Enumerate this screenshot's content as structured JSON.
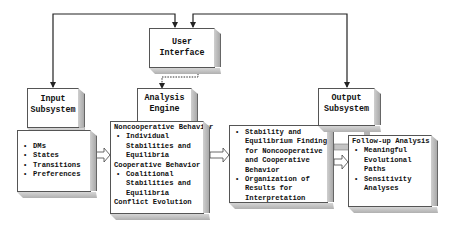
{
  "user_interface": {
    "title_line1": "User",
    "title_line2": "Interface"
  },
  "input": {
    "title_line1": "Input",
    "title_line2": "Subsystem",
    "items": [
      "DMs",
      "States",
      "Transitions",
      "Preferences"
    ]
  },
  "analysis": {
    "title_line1": "Analysis",
    "title_line2": "Engine",
    "sections": [
      {
        "heading": "Noncooperative Behavior",
        "item": "Individual\nStabilities and\nEquilibria"
      },
      {
        "heading": "Cooperative Behavior",
        "item": "Coalitional\nStabilities and\nEquilibria"
      }
    ],
    "footer": "Conflict Evolution"
  },
  "stability": {
    "items": [
      "Stability and\nEquilibrium Findings\nfor Noncooperative\nand Cooperative\nBehavior",
      "Organization of\nResults for\nInterpretation"
    ]
  },
  "output": {
    "title_line1": "Output",
    "title_line2": "Subsystem",
    "heading": "Follow-up Analysis",
    "items": [
      "Meaningful\nEvolutional\nPaths",
      "Sensitivity\nAnalyses"
    ]
  },
  "bullet_glyph": "•",
  "colors": {
    "line": "#222222",
    "shade": "#b5b5b5",
    "border": "#555555"
  }
}
